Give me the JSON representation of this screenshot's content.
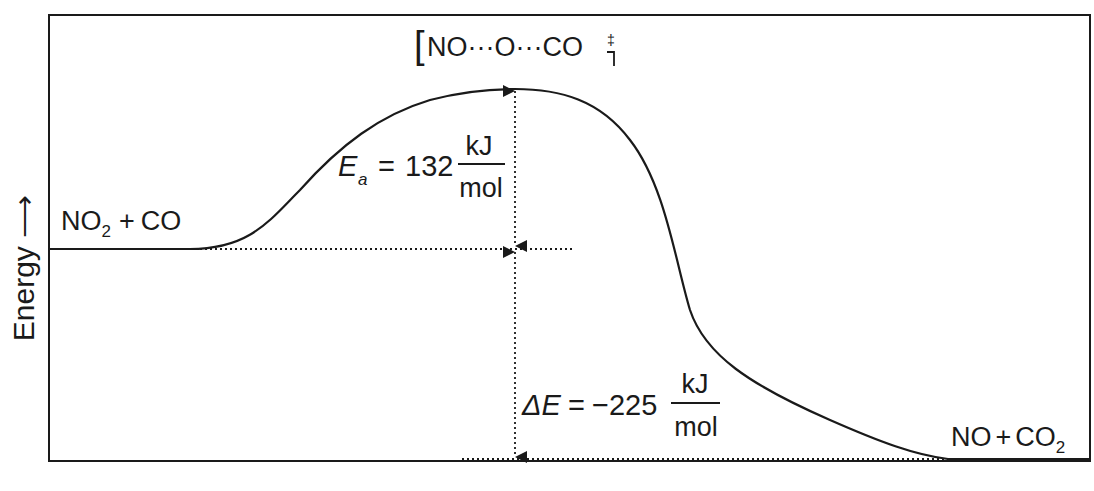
{
  "diagram": {
    "type": "reaction-energy-profile",
    "y_axis_label": "Energy",
    "reactants": {
      "species": "NO",
      "subscript": "2",
      "plus": "+",
      "partner": "CO"
    },
    "products": {
      "species": "NO",
      "plus": "+",
      "partner": "CO",
      "subscript": "2"
    },
    "transition_state": {
      "open_bracket": "[",
      "content": "NO···O···CO",
      "close_bracket": "]",
      "charge": "‡"
    },
    "activation_energy": {
      "symbol": "E",
      "subscript": "a",
      "equals": "=",
      "value": "132",
      "unit_num": "kJ",
      "unit_den": "mol"
    },
    "delta_energy": {
      "symbol": "ΔE",
      "equals": "=",
      "value": "−225",
      "unit_num": "kJ",
      "unit_den": "mol"
    },
    "colors": {
      "line": "#1a1a1a",
      "background": "#ffffff"
    }
  }
}
